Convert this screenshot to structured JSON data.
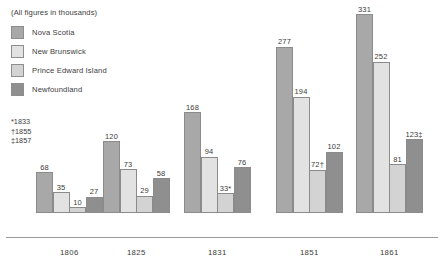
{
  "legend": {
    "title": "(All figures in thousands)",
    "items": [
      {
        "label": "Nova Scotia",
        "color": "#a8a8a8"
      },
      {
        "label": "New Brunswick",
        "color": "#e2e2e2"
      },
      {
        "label": "Prince Edward Island",
        "color": "#d3d3d3"
      },
      {
        "label": "Newfoundland",
        "color": "#8f8f8f"
      }
    ]
  },
  "footnotes": [
    "*1833",
    "†1855",
    "‡1857"
  ],
  "chart_data": {
    "type": "bar",
    "title": "(All figures in thousands)",
    "xlabel": "",
    "ylabel": "",
    "ylim": [
      0,
      340
    ],
    "grid": false,
    "legend_position": "top-left",
    "categories": [
      "1806",
      "1825",
      "1831",
      "1851",
      "1861"
    ],
    "series": [
      {
        "name": "Nova Scotia",
        "color": "#a8a8a8",
        "values": [
          68,
          120,
          168,
          277,
          331
        ],
        "labels": [
          "68",
          "120",
          "168",
          "277",
          "331"
        ]
      },
      {
        "name": "New Brunswick",
        "color": "#e2e2e2",
        "values": [
          35,
          73,
          94,
          194,
          252
        ],
        "labels": [
          "35",
          "73",
          "94",
          "194",
          "252"
        ]
      },
      {
        "name": "Prince Edward Island",
        "color": "#d3d3d3",
        "values": [
          10,
          29,
          33,
          72,
          81
        ],
        "labels": [
          "10",
          "29",
          "33*",
          "72†",
          "81"
        ]
      },
      {
        "name": "Newfoundland",
        "color": "#8f8f8f",
        "values": [
          27,
          58,
          76,
          102,
          123
        ],
        "labels": [
          "27",
          "58",
          "76",
          "102",
          "123‡"
        ]
      }
    ]
  }
}
